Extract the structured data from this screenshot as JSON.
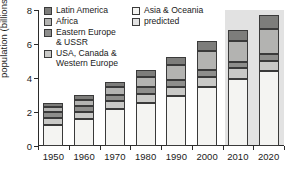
{
  "chart_data": {
    "type": "bar",
    "title": "",
    "subtitle": "",
    "xlabel": "",
    "ylabel": "population (billions)",
    "categories": [
      "1950",
      "1960",
      "1970",
      "1980",
      "1990",
      "2000",
      "2010",
      "2020"
    ],
    "ylim": [
      0,
      8
    ],
    "yticks": [
      0,
      2,
      4,
      6,
      8
    ],
    "ytick_labels": [
      "0",
      "2",
      "4",
      "6",
      "8"
    ],
    "grid": false,
    "stacked": true,
    "legend_position": "top-inside",
    "series": [
      {
        "name": "Asia & Oceania",
        "color": "#f4f4f2",
        "values": [
          1.25,
          1.58,
          2.15,
          2.52,
          2.92,
          3.48,
          3.95,
          4.4
        ]
      },
      {
        "name": "USA, Canada & Western Europe",
        "color": "#c9c9c7",
        "values": [
          0.42,
          0.45,
          0.52,
          0.55,
          0.58,
          0.6,
          0.62,
          0.62
        ]
      },
      {
        "name": "Eastern Europe & USSR",
        "color": "#8e8e8c",
        "values": [
          0.32,
          0.34,
          0.36,
          0.38,
          0.4,
          0.4,
          0.4,
          0.42
        ]
      },
      {
        "name": "Africa",
        "color": "#b3b3b1",
        "values": [
          0.28,
          0.35,
          0.44,
          0.62,
          0.85,
          1.1,
          1.18,
          1.45
        ]
      },
      {
        "name": "Latin America",
        "color": "#7d7d7b",
        "values": [
          0.28,
          0.3,
          0.28,
          0.43,
          0.5,
          0.57,
          0.65,
          0.81
        ]
      }
    ],
    "totals": [
      2.55,
      3.02,
      3.75,
      4.5,
      5.25,
      6.15,
      6.8,
      7.7
    ],
    "annotations": [
      {
        "name": "predicted-region",
        "label": "predicted",
        "covers": [
          "2010",
          "2020"
        ],
        "color": "#e2e2e2"
      }
    ]
  },
  "legend": {
    "columns": [
      {
        "entries": [
          {
            "label": "Latin America",
            "color": "#7d7d7b",
            "swatch_name": "legend-swatch-latin-america"
          },
          {
            "label": "Africa",
            "color": "#b3b3b1",
            "swatch_name": "legend-swatch-africa"
          },
          {
            "label": "Eastern Europe\n& USSR",
            "color": "#8e8e8c",
            "swatch_name": "legend-swatch-eastern-europe-ussr"
          },
          {
            "label": "USA, Canada &\nWestern Europe",
            "color": "#c9c9c7",
            "swatch_name": "legend-swatch-usa-canada-western-europe"
          }
        ]
      },
      {
        "entries": [
          {
            "label": "Asia & Oceania",
            "color": "#f4f4f2",
            "swatch_name": "legend-swatch-asia-oceania"
          },
          {
            "label": "predicted",
            "color": "#e2e2e2",
            "swatch_name": "legend-swatch-predicted"
          }
        ]
      }
    ]
  },
  "axes": {
    "y_title": "population (billions)",
    "y_labels": [
      "8",
      "6",
      "4",
      "2",
      "0"
    ],
    "x_labels": [
      "1950",
      "1960",
      "1970",
      "1980",
      "1990",
      "2000",
      "2010",
      "2020"
    ]
  },
  "colors": {
    "axis": "#2b2b2b",
    "outline": "#3a3a3a",
    "background": "#ffffff",
    "predicted_band": "#e2e2e2"
  }
}
